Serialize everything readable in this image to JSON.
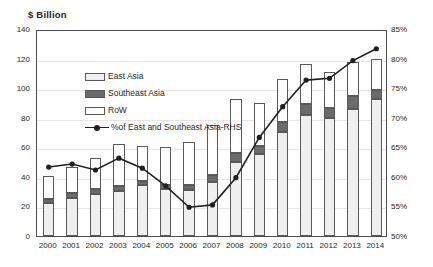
{
  "chart_data": {
    "type": "bar",
    "title": "",
    "ylabel": "$ Billion",
    "xlabel": "",
    "ylim": [
      0,
      140
    ],
    "y2lim": [
      50,
      85
    ],
    "ytick_labels": [
      "140",
      "120",
      "100",
      "80",
      "60",
      "40",
      "20",
      "0"
    ],
    "y2tick_labels": [
      "85%",
      "80%",
      "75%",
      "70%",
      "65%",
      "60%",
      "55%",
      "50%"
    ],
    "grid": true,
    "legend_position": "inside-top-left",
    "stacked": true,
    "categories": [
      "2000",
      "2001",
      "2002",
      "2003",
      "2004",
      "2005",
      "2006",
      "2007",
      "2008",
      "2009",
      "2010",
      "2011",
      "2012",
      "2013",
      "2014"
    ],
    "series": [
      {
        "name": "East Asia",
        "axis": "left",
        "values": [
          22.5,
          26.0,
          28.5,
          30.5,
          34.5,
          32.0,
          31.0,
          36.5,
          50.0,
          55.5,
          70.5,
          82.0,
          79.5,
          86.0,
          93.0
        ]
      },
      {
        "name": "Southeast Asia",
        "axis": "left",
        "values": [
          2.5,
          3.0,
          3.5,
          3.5,
          3.0,
          2.5,
          3.5,
          5.0,
          6.0,
          5.5,
          6.5,
          7.5,
          7.0,
          9.0,
          6.0
        ]
      },
      {
        "name": "RoW",
        "axis": "left",
        "values": [
          15.5,
          18.0,
          21.0,
          28.0,
          23.5,
          26.0,
          29.0,
          33.5,
          37.0,
          29.0,
          29.0,
          27.0,
          24.5,
          23.0,
          21.0
        ]
      },
      {
        "name": "%of East and Southeast Asia-RHS",
        "axis": "right",
        "unit": "%",
        "values": [
          62.0,
          62.5,
          61.5,
          63.5,
          61.8,
          58.8,
          55.2,
          55.6,
          60.2,
          67.0,
          72.2,
          76.7,
          77.0,
          80.0,
          82.0
        ]
      }
    ],
    "totals": [
      40.5,
      47.0,
      53.0,
      62.0,
      61.0,
      60.5,
      63.5,
      75.0,
      93.0,
      90.0,
      106.0,
      116.5,
      111.0,
      118.0,
      120.0
    ]
  },
  "legend": {
    "items": [
      {
        "label": "East Asia",
        "marker": "east-asia-swatch"
      },
      {
        "label": "Southeast Asia",
        "marker": "southeast-asia-swatch"
      },
      {
        "label": "RoW",
        "marker": "row-swatch"
      },
      {
        "label": "%of East and Southeast Asia-RHS",
        "marker": "line-marker-swatch"
      }
    ]
  },
  "colors": {
    "east_asia": "#efefef",
    "southeast_asia": "#d9d9d9",
    "row": "#ffffff",
    "line": "#231f20",
    "grid": "#e6e6e6",
    "axis": "#4d4d4d"
  }
}
